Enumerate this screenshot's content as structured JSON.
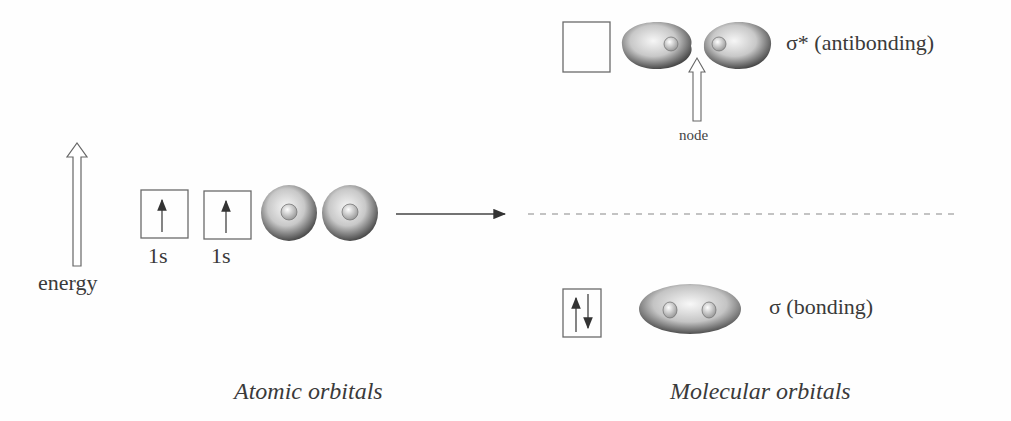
{
  "axis": {
    "energy_label": "energy"
  },
  "atomic": {
    "orbitals": [
      {
        "label": "1s",
        "electrons": "up"
      },
      {
        "label": "1s",
        "electrons": "up"
      }
    ],
    "caption": "Atomic orbitals"
  },
  "molecular": {
    "antibonding": {
      "label": "σ* (antibonding)",
      "electrons": "empty"
    },
    "bonding": {
      "label": "σ (bonding)",
      "electrons": "up-down"
    },
    "node_label": "node",
    "caption": "Molecular orbitals"
  },
  "colors": {
    "line": "#555555",
    "box": "#6a6a6a",
    "lobe_dark": "#5a5a5a",
    "lobe_light": "#f2f2f2"
  }
}
